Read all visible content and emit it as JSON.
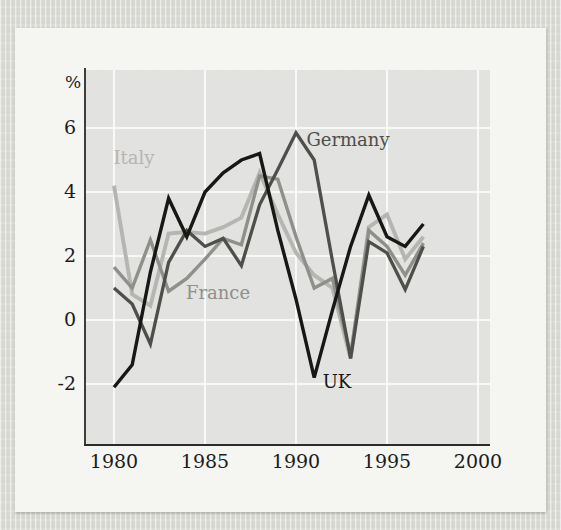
{
  "figure": {
    "page_background_color": "#d8d8d3",
    "card_color": "#f7f7f3",
    "plot_background_color": "#e2e2e0",
    "grid_color": "#ffffff",
    "axis_color": "#2b2b28",
    "tick_text_color": "#1c1c1a",
    "percent_label": "%"
  },
  "chart_data": {
    "type": "line",
    "title": "",
    "xlabel": "",
    "ylabel": "%",
    "grid": true,
    "legend_position": "inline-labels",
    "xlim": [
      1978.4,
      2000.7
    ],
    "ylim": [
      -3.9,
      7.8
    ],
    "x_ticks": [
      "1980",
      "1985",
      "1990",
      "1995",
      "2000"
    ],
    "x_tick_years": [
      1980,
      1985,
      1990,
      1995,
      2000
    ],
    "y_ticks": [
      "6",
      "4",
      "2",
      "0",
      "-2"
    ],
    "y_tick_values": [
      6,
      4,
      2,
      0,
      -2
    ],
    "years": [
      1980,
      1981,
      1982,
      1983,
      1984,
      1985,
      1986,
      1987,
      1988,
      1989,
      1990,
      1991,
      1992,
      1993,
      1994,
      1995,
      1996,
      1997
    ],
    "series": [
      {
        "name": "Italy",
        "color": "#b5b5b1",
        "label": {
          "text": "Italy",
          "x": 134,
          "y": 164
        },
        "values": [
          4.2,
          0.8,
          0.45,
          2.7,
          2.75,
          2.7,
          2.9,
          3.2,
          4.6,
          3.3,
          2.1,
          1.4,
          1.0,
          -1.2,
          2.9,
          3.3,
          1.9,
          2.6
        ]
      },
      {
        "name": "France",
        "color": "#8f8f8b",
        "label": {
          "text": "France",
          "x": 218,
          "y": 299
        },
        "values": [
          1.65,
          1.0,
          2.5,
          0.9,
          1.3,
          1.9,
          2.55,
          2.35,
          4.5,
          4.4,
          2.6,
          1.0,
          1.3,
          -1.1,
          2.8,
          2.3,
          1.4,
          2.4
        ]
      },
      {
        "name": "Germany",
        "color": "#4e4e4a",
        "label": {
          "text": "Germany",
          "x": 348,
          "y": 146
        },
        "values": [
          1.0,
          0.5,
          -0.75,
          1.8,
          2.8,
          2.3,
          2.55,
          1.7,
          3.6,
          4.7,
          5.85,
          5.0,
          1.85,
          -1.2,
          2.45,
          2.1,
          0.95,
          2.3
        ]
      },
      {
        "name": "UK",
        "color": "#171715",
        "label": {
          "text": "UK",
          "x": 337,
          "y": 388
        },
        "values": [
          -2.1,
          -1.4,
          1.5,
          3.8,
          2.6,
          4.0,
          4.6,
          5.0,
          5.2,
          2.8,
          0.65,
          -1.8,
          0.3,
          2.3,
          3.9,
          2.6,
          2.3,
          3.0
        ]
      }
    ]
  }
}
